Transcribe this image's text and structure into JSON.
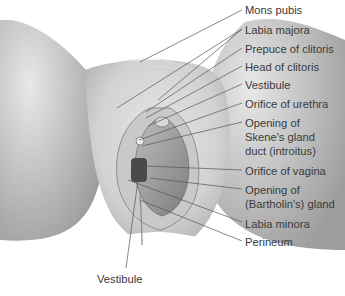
{
  "figure": {
    "type": "anatomical-illustration"
  },
  "labels": [
    {
      "text": "Mons pubis",
      "top": 4
    },
    {
      "text": "Labia majora",
      "top": 24
    },
    {
      "text": "Prepuce of clitoris",
      "top": 43
    },
    {
      "text": "Head of clitoris",
      "top": 61
    },
    {
      "text": "Vestibule",
      "top": 79
    },
    {
      "text": "Orifice of urethra",
      "top": 98
    },
    {
      "text": "Opening of",
      "top": 117
    },
    {
      "text": "Skene's gland",
      "top": 131
    },
    {
      "text": "duct (introitus)",
      "top": 145
    },
    {
      "text": "Orifice of vagina",
      "top": 165
    },
    {
      "text": "Opening of",
      "top": 184
    },
    {
      "text": "(Bartholin's) gland",
      "top": 198
    },
    {
      "text": "Labia minora",
      "top": 218
    },
    {
      "text": "Perineum",
      "top": 236
    }
  ],
  "bottom_label": {
    "text": "Vestibule"
  }
}
